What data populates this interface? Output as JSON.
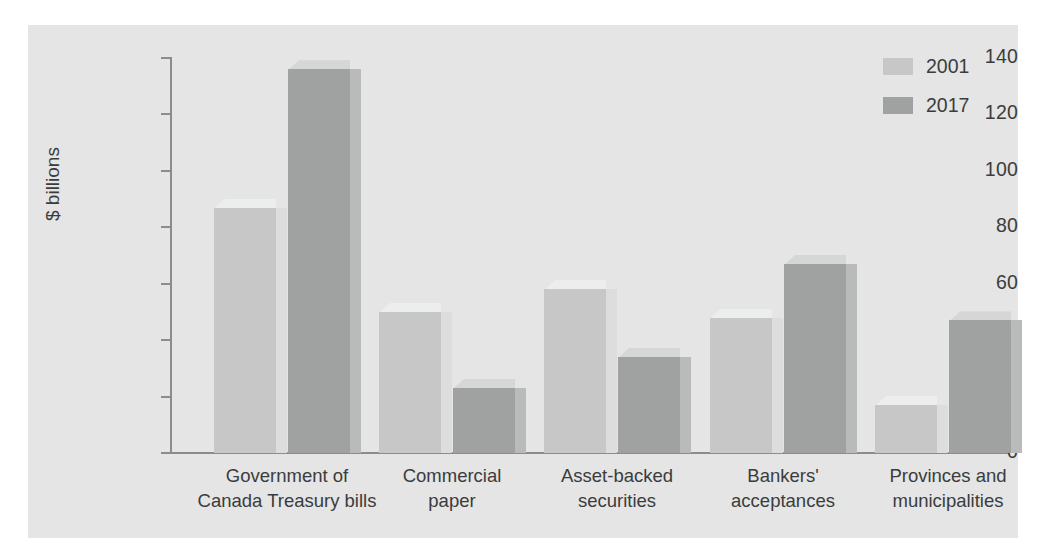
{
  "chart_data": {
    "type": "bar",
    "title": "",
    "xlabel": "",
    "ylabel": "$ billions",
    "ylim": [
      0,
      140
    ],
    "yticks": [
      "0",
      "20",
      "40",
      "60",
      "80",
      "100",
      "120",
      "140"
    ],
    "grid": false,
    "legend_position": "top-right",
    "categories": [
      "Government of\nCanada Treasury bills",
      "Commercial\npaper",
      "Asset-backed\nsecurities",
      "Bankers'\nacceptances",
      "Provinces and\nmunicipalities"
    ],
    "categories_lines": [
      [
        "Government of",
        "Canada Treasury bills"
      ],
      [
        "Commercial",
        "paper"
      ],
      [
        "Asset-backed",
        "securities"
      ],
      [
        "Bankers'",
        "acceptances"
      ],
      [
        "Provinces and",
        "municipalities"
      ]
    ],
    "series": [
      {
        "name": "2001",
        "color": "#c6c7c6",
        "values": [
          87,
          50,
          58,
          48,
          17
        ]
      },
      {
        "name": "2017",
        "color": "#a0a2a1",
        "values": [
          136,
          23,
          34,
          67,
          47
        ]
      }
    ]
  },
  "legend": {
    "items": [
      {
        "label": "2001",
        "color": "#c6c7c6"
      },
      {
        "label": "2017",
        "color": "#a0a2a1"
      }
    ]
  },
  "axis": {
    "y_title": "$ billions",
    "y_tick_labels": [
      "140",
      "120",
      "100",
      "80",
      "60",
      "40",
      "20",
      "0"
    ]
  },
  "colors": {
    "panel_background": "#e4e5e4",
    "page_background": "#ffffff",
    "axis": "#8b8c8b",
    "text": "#3b3c3d",
    "series_2001": "#c6c7c6",
    "series_2017": "#a0a2a1"
  }
}
